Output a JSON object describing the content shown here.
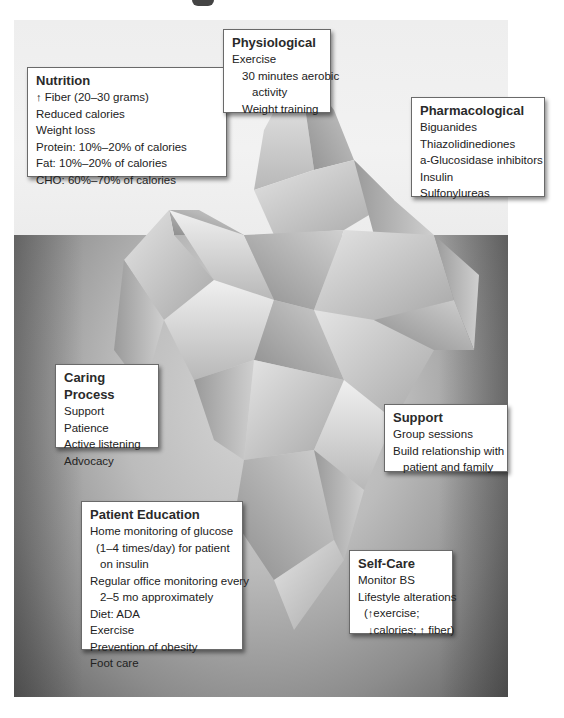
{
  "diagram": {
    "type": "iceberg",
    "boxes": {
      "nutrition": {
        "title": "Nutrition",
        "lines": [
          {
            "prefix": "↑",
            "text": " Fiber (20–30 grams)"
          },
          {
            "text": "Reduced calories"
          },
          {
            "text": "Weight loss"
          },
          {
            "text": "Protein: 10%–20% of calories"
          },
          {
            "text": "Fat: 10%–20% of calories"
          },
          {
            "text": "CHO: 60%–70% of calories"
          }
        ]
      },
      "physiological": {
        "title": "Physiological",
        "lines": [
          {
            "text": "Exercise"
          },
          {
            "text": "30 minutes aerobic"
          },
          {
            "text": "activity"
          },
          {
            "text": "Weight training"
          }
        ]
      },
      "pharmacological": {
        "title": "Pharmacological",
        "lines": [
          {
            "text": "Biguanides"
          },
          {
            "text": "Thiazolidinediones"
          },
          {
            "text": "a-Glucosidase inhibitors"
          },
          {
            "text": "Insulin"
          },
          {
            "text": "Sulfonylureas"
          }
        ]
      },
      "caring_process": {
        "title": "Caring Process",
        "lines": [
          {
            "text": "Support"
          },
          {
            "text": "Patience"
          },
          {
            "text": "Active listening"
          },
          {
            "text": "Advocacy"
          }
        ]
      },
      "support": {
        "title": "Support",
        "lines": [
          {
            "text": "Group sessions"
          },
          {
            "text": "Build relationship with"
          },
          {
            "text": "patient and family"
          }
        ]
      },
      "patient_education": {
        "title": "Patient Education",
        "lines": [
          {
            "text": "Home monitoring of glucose"
          },
          {
            "text": "(1–4 times/day) for patient"
          },
          {
            "text": "on insulin"
          },
          {
            "text": "Regular office monitoring every"
          },
          {
            "text": "2–5 mo approximately"
          },
          {
            "text": "Diet: ADA"
          },
          {
            "text": "Exercise"
          },
          {
            "text": "Prevention of obesity"
          },
          {
            "text": "Foot care"
          }
        ]
      },
      "self_care": {
        "title": "Self-Care",
        "lines": [
          {
            "text": "Monitor BS"
          },
          {
            "text": "Lifestyle alterations"
          },
          {
            "a1": "(",
            "up1": "↑",
            "t1": "exercise;"
          },
          {
            "down": "↓",
            "t2": "calories; ",
            "up2": "↑",
            "t3": " fiber)"
          }
        ]
      }
    },
    "colors": {
      "sky": "#eeeeee",
      "water_light": "#d6d6d6",
      "water_dark": "#606060",
      "box_bg": "#ffffff",
      "box_border": "#6a6a6a",
      "text": "#222222"
    }
  }
}
